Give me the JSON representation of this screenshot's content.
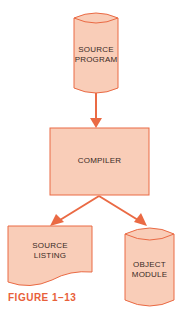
{
  "diagram": {
    "nodes": [
      {
        "id": "source-program",
        "shape": "cylinder",
        "label_lines": [
          "SOURCE",
          "PROGRAM"
        ]
      },
      {
        "id": "compiler",
        "shape": "rectangle",
        "label_lines": [
          "COMPILER"
        ]
      },
      {
        "id": "source-listing",
        "shape": "document",
        "label_lines": [
          "SOURCE",
          "LISTING"
        ]
      },
      {
        "id": "object-module",
        "shape": "cylinder",
        "label_lines": [
          "OBJECT",
          "MODULE"
        ]
      }
    ],
    "edges": [
      {
        "from": "source-program",
        "to": "compiler"
      },
      {
        "from": "compiler",
        "to": "source-listing"
      },
      {
        "from": "compiler",
        "to": "object-module"
      }
    ],
    "caption": "FIGURE 1–13"
  },
  "colors": {
    "fill": "#f9cdb8",
    "stroke": "#ea6a44",
    "caption": "#e8603a",
    "text": "#3a2a25"
  }
}
